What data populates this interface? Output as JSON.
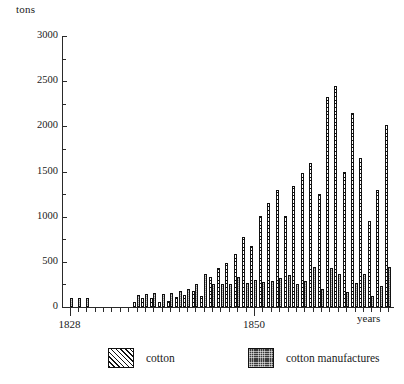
{
  "chart_data": {
    "type": "bar",
    "title": "",
    "subtitle": "",
    "ylabel": "tons",
    "xlabel": "years",
    "ylim": [
      0,
      3000
    ],
    "yticks": [
      0,
      500,
      1000,
      1500,
      2000,
      2500,
      3000
    ],
    "ytick_labels": [
      "0",
      "500",
      "1000",
      "1500",
      "2000",
      "2500",
      "3000"
    ],
    "y_minor_ticks": [
      250,
      750,
      1250,
      1750,
      2250,
      2750
    ],
    "grid": false,
    "legend_position": "bottom",
    "legend": [
      "cotton",
      "cotton manufactures"
    ],
    "xtick_labels": [
      "1828",
      "1850"
    ],
    "xtick_label_years": [
      1828,
      1850
    ],
    "categories": [
      1828,
      1829,
      1830,
      1831,
      1832,
      1833,
      1834,
      1835,
      1836,
      1837,
      1838,
      1839,
      1840,
      1841,
      1842,
      1843,
      1844,
      1845,
      1846,
      1847,
      1848,
      1849,
      1850,
      1851,
      1852,
      1853,
      1854,
      1855,
      1856,
      1857,
      1858,
      1859,
      1860,
      1861,
      1862,
      1863,
      1864,
      1865,
      1866
    ],
    "series": [
      {
        "name": "cotton",
        "values": [
          0,
          0,
          0,
          0,
          0,
          0,
          0,
          0,
          60,
          95,
          100,
          55,
          70,
          110,
          130,
          180,
          120,
          330,
          430,
          490,
          590,
          780,
          670,
          1010,
          1150,
          1300,
          1010,
          1340,
          1480,
          1590,
          1250,
          2330,
          2450,
          1500,
          2150,
          1650,
          950,
          1300,
          2020
        ]
      },
      {
        "name": "cotton manufactures",
        "values": [
          95,
          105,
          100,
          0,
          0,
          0,
          0,
          0,
          130,
          145,
          150,
          140,
          160,
          175,
          200,
          260,
          370,
          250,
          255,
          260,
          330,
          270,
          300,
          280,
          290,
          320,
          350,
          250,
          290,
          440,
          200,
          430,
          370,
          170,
          270,
          370,
          120,
          230,
          440
        ]
      }
    ]
  }
}
